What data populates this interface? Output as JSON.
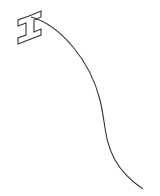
{
  "drawing": {
    "stroke_color": "#333333",
    "background": "#ffffff",
    "shapes": [
      {
        "name": "i-beam-glyph",
        "description": "rotated I-beam / cursor-like outline shape"
      },
      {
        "name": "curve-line",
        "description": "single curved stroke descending from the glyph"
      }
    ]
  }
}
